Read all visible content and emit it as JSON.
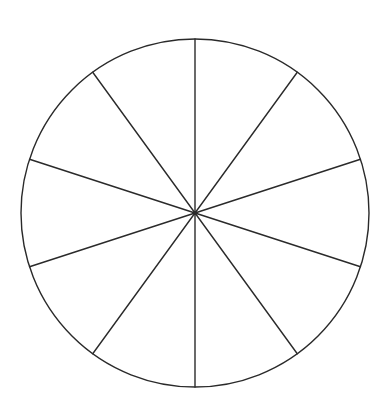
{
  "diagram": {
    "type": "divided-circle",
    "background_color": "#ffffff",
    "stroke_color": "#2a2a2a",
    "stroke_width": 1.4,
    "center": {
      "x": 195,
      "y": 213
    },
    "radius": 174,
    "sector_count": 10,
    "sector_angle_deg": 36,
    "spoke_angles_deg": [
      18,
      54,
      90,
      126,
      162,
      198,
      234,
      270,
      306,
      342
    ]
  }
}
